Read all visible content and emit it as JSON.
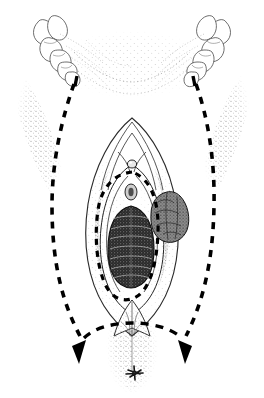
{
  "figure": {
    "domain": "medical-anatomical-line-drawing",
    "medium": "pen-and-ink stipple line drawing",
    "palette": {
      "background": "#ffffff",
      "ink": "#000000",
      "line": "#1a1a1a",
      "stipple_light": "#8c8c8c",
      "stipple_mid": "#5a5a5a",
      "stipple_dark": "#2b2b2b",
      "tissue_dark": "#202020",
      "lesion_fill": "#6b6b6b"
    },
    "canvas": {
      "width": 264,
      "height": 398
    },
    "has_text_labels": false,
    "caption": ""
  },
  "annotations": {
    "outer_incision_label": "outer dashed incision line",
    "inner_incision_label": "inner dashed incision line",
    "arrow_left_label": "left arrowhead",
    "arrow_right_label": "right arrowhead"
  },
  "structures": [
    {
      "id": "left-hand-fingers",
      "name": "left retracting fingers",
      "side": "left"
    },
    {
      "id": "right-hand-fingers",
      "name": "right retracting fingers",
      "side": "right"
    },
    {
      "id": "left-inguinal-fold",
      "name": "left inguinal crease shading",
      "side": "left"
    },
    {
      "id": "right-inguinal-fold",
      "name": "right inguinal crease shading",
      "side": "right"
    },
    {
      "id": "mons-pubis",
      "name": "mons pubis / anterior commissure",
      "side": "center"
    },
    {
      "id": "labia-majora-left",
      "name": "left labium majus",
      "side": "left"
    },
    {
      "id": "labia-majora-right",
      "name": "right labium majus",
      "side": "right"
    },
    {
      "id": "labia-minora",
      "name": "labia minora",
      "side": "center"
    },
    {
      "id": "clitoris",
      "name": "clitoris",
      "side": "center"
    },
    {
      "id": "urethral-meatus",
      "name": "urethral meatus",
      "side": "center"
    },
    {
      "id": "vaginal-introitus",
      "name": "vaginal introitus with rugae",
      "side": "center"
    },
    {
      "id": "vulvar-lesion",
      "name": "nodular vulvar lesion",
      "side": "right"
    },
    {
      "id": "posterior-fourchette",
      "name": "posterior fourchette",
      "side": "center"
    },
    {
      "id": "perineum",
      "name": "perineum",
      "side": "center"
    },
    {
      "id": "anus",
      "name": "anus",
      "side": "center"
    },
    {
      "id": "outer-incision",
      "name": "outer dashed incision margin",
      "side": "bilateral"
    },
    {
      "id": "inner-incision",
      "name": "inner dashed incision margin",
      "side": "center"
    }
  ],
  "geometry": {
    "outer_incision_left": "M 74,84 C 62,118 52,160 52,206 C 52,262 62,300 80,334",
    "outer_incision_right": "M 196,84 C 208,118 215,160 214,206 C 213,262 203,300 186,334",
    "cross_arc": "M 78,334 C 104,316 160,316 186,334",
    "inner_incision": "M 132,169 C 112,171 100,186 97,208 C 93,236 96,268 105,286 C 113,301 128,305 140,296 C 152,286 158,262 159,232 C 160,202 153,178 132,169 Z",
    "introitus": "M 131,208 C 117,210 110,226 110,248 C 110,270 117,284 131,285 C 145,284 152,270 152,248 C 152,226 145,210 131,208 Z",
    "lesion": "M 168,194 C 157,197 152,208 153,220 C 154,233 161,241 172,241 C 183,241 190,232 190,219 C 190,205 180,193 168,194 Z"
  }
}
